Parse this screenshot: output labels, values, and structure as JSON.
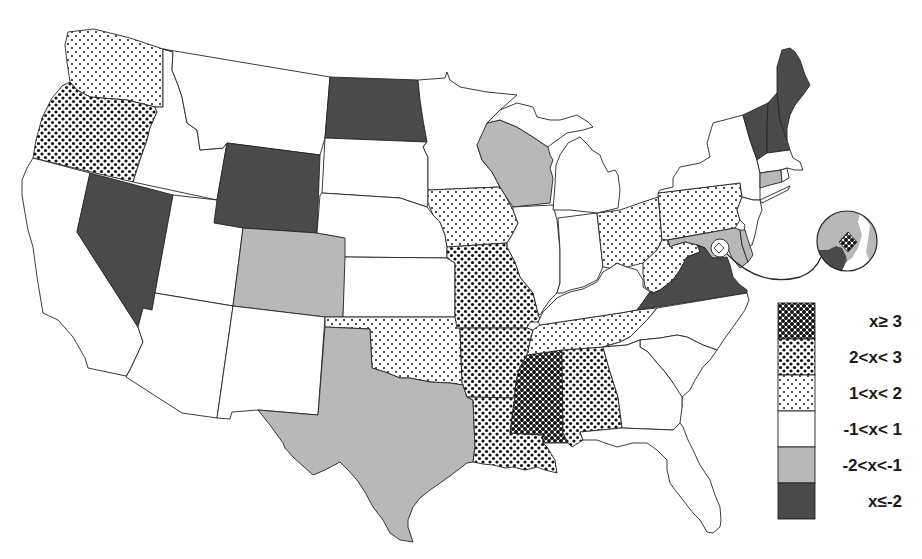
{
  "figure": {
    "type": "choropleth-map",
    "region": "contiguous United States"
  },
  "colors": {
    "white": "#ffffff",
    "light_gray": "#b8b8b8",
    "dark": "#4a4a4a",
    "dot": "#111111",
    "border": "#262626"
  },
  "legend": {
    "entries": [
      {
        "id": "ge3",
        "label": "x≥ 3",
        "style": "large dense dots"
      },
      {
        "id": "2to3",
        "label": "2<x< 3",
        "style": "medium dots"
      },
      {
        "id": "1to2",
        "label": "1<x< 2",
        "style": "small sparse dots"
      },
      {
        "id": "neg1to1",
        "label": "-1<x< 1",
        "style": "white"
      },
      {
        "id": "neg2toneg1",
        "label": "-2<x<-1",
        "style": "light gray"
      },
      {
        "id": "le_neg2",
        "label": "x≤-2",
        "style": "dark gray"
      }
    ]
  },
  "states": {
    "WA": "1to2",
    "OR": "2to3",
    "CA": "neg1to1",
    "NV": "le_neg2",
    "ID": "neg1to1",
    "MT": "neg1to1",
    "WY": "le_neg2",
    "UT": "neg1to1",
    "CO": "neg2toneg1",
    "AZ": "neg1to1",
    "NM": "neg1to1",
    "ND": "le_neg2",
    "SD": "neg1to1",
    "NE": "neg1to1",
    "KS": "neg1to1",
    "OK": "1to2",
    "TX": "neg2toneg1",
    "MN": "neg1to1",
    "IA": "1to2",
    "MO": "2to3",
    "AR": "2to3",
    "LA": "2to3",
    "WI": "neg2toneg1",
    "IL": "neg1to1",
    "MI": "neg1to1",
    "IN": "neg1to1",
    "OH": "1to2",
    "KY": "neg1to1",
    "TN": "1to2",
    "MS": "ge3",
    "AL": "2to3",
    "GA": "neg1to1",
    "FL": "neg1to1",
    "SC": "neg1to1",
    "NC": "neg1to1",
    "VA": "le_neg2",
    "WV": "1to2",
    "PA": "1to2",
    "NY": "neg1to1",
    "NJ": "neg1to1",
    "DE": "neg2toneg1",
    "MD": "neg2toneg1",
    "CT": "neg2toneg1",
    "RI": "neg1to1",
    "MA": "neg1to1",
    "VT": "le_neg2",
    "NH": "le_neg2",
    "ME": "le_neg2",
    "DC": "ge3"
  },
  "inset": {
    "subject": "DC",
    "category": "ge3",
    "surrounding": {
      "MD": "neg2toneg1",
      "VA": "le_neg2"
    }
  }
}
